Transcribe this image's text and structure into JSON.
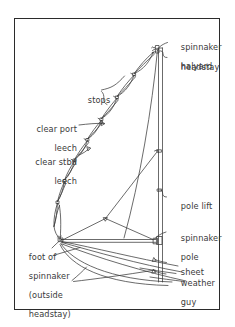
{
  "diagram": {
    "type": "line-drawing",
    "frame": {
      "border_color": "#2b2b2b",
      "background": "#ffffff"
    },
    "line_color": "#3a3a3a",
    "text_color": "#3a3a3a"
  },
  "labels": {
    "spinnaker_halyard": {
      "line1": "spinnaker",
      "line2": "halyard"
    },
    "headstay": {
      "line1": "headstay"
    },
    "stops": {
      "line1": "stops"
    },
    "clear_port_leech": {
      "line1": "clear port",
      "line2": "leech"
    },
    "clear_stbd_leech": {
      "line1": "clear stbd",
      "line2": "leech"
    },
    "pole_lift": {
      "line1": "pole lift"
    },
    "spinnaker_pole": {
      "line1": "spinnaker",
      "line2": "pole"
    },
    "sheet": {
      "line1": "sheet"
    },
    "weather_guy": {
      "line1": "weather",
      "line2": "guy"
    },
    "foot_of_spinnaker": {
      "line1": "foot of",
      "line2": "spinnaker",
      "line3": "(outside",
      "line4": "headstay)"
    }
  },
  "parts": {
    "mast": "mast",
    "headstay_line": "headstay",
    "sail_bundle": "spinnaker stopped in bundle",
    "pole": "spinnaker pole",
    "pole_lift_line": "pole lift",
    "pole_bridle": "pole bridle",
    "sheet_line": "sheet",
    "guy_line": "weather guy",
    "foot_line": "foot of spinnaker",
    "tack_fitting": "tack fitting",
    "masthead_fitting": "masthead fitting"
  }
}
